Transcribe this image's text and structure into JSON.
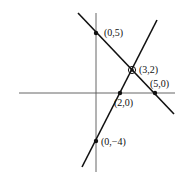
{
  "diagram": {
    "type": "coordinate-graph",
    "axes": {
      "x_axis": {
        "x1": 19,
        "y1": 93,
        "x2": 175,
        "y2": 93
      },
      "y_axis": {
        "x1": 96,
        "y1": 13,
        "x2": 96,
        "y2": 172
      }
    },
    "lines": [
      {
        "name": "decreasing-line",
        "through": [
          "(0,5)",
          "(3,2)",
          "(5,0)"
        ],
        "x1": 78,
        "y1": 13,
        "x2": 174,
        "y2": 114
      },
      {
        "name": "increasing-line",
        "through": [
          "(0,-4)",
          "(2,0)",
          "(3,2)"
        ],
        "x1": 82,
        "y1": 167,
        "x2": 157,
        "y2": 20
      }
    ],
    "points": [
      {
        "label": "(0,5)",
        "cx": 96,
        "cy": 33,
        "lx": 104,
        "ly": 36,
        "style": "filled"
      },
      {
        "label": "(3,2)",
        "cx": 132,
        "cy": 70,
        "lx": 139,
        "ly": 73,
        "style": "circled"
      },
      {
        "label": "(5,0)",
        "cx": 155,
        "cy": 93,
        "lx": 150,
        "ly": 87,
        "style": "filled"
      },
      {
        "label": "(2,0)",
        "cx": 120,
        "cy": 93,
        "lx": 114,
        "ly": 106,
        "style": "filled"
      },
      {
        "label": "(0,−4)",
        "cx": 96,
        "cy": 141,
        "lx": 101,
        "ly": 145,
        "style": "filled"
      }
    ]
  }
}
